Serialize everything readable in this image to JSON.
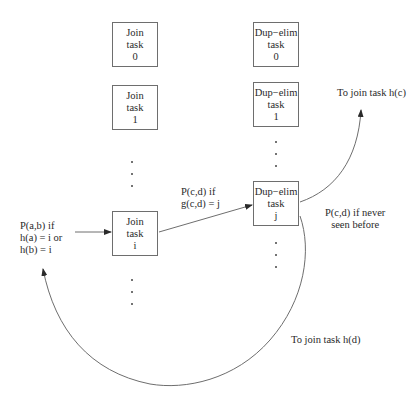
{
  "diagram": {
    "type": "dataflow",
    "join_column": {
      "tasks": [
        {
          "line1": "Join",
          "line2": "task",
          "line3": "0"
        },
        {
          "line1": "Join",
          "line2": "task",
          "line3": "1"
        },
        {
          "line1": "Join",
          "line2": "task",
          "line3": "i"
        }
      ]
    },
    "dupelim_column": {
      "tasks": [
        {
          "line1": "Dup−elim",
          "line2": "task",
          "line3": "0"
        },
        {
          "line1": "Dup−elim",
          "line2": "task",
          "line3": "1"
        },
        {
          "line1": "Dup−elim",
          "line2": "task",
          "line3": "j"
        }
      ]
    },
    "labels": {
      "input": {
        "line1": "P(a,b) if",
        "line2": "h(a) = i or",
        "line3": "h(b) = i"
      },
      "join_to_dup": {
        "line1": "P(c,d) if",
        "line2": "g(c,d) = j"
      },
      "never_seen": {
        "line1": "P(c,d) if never",
        "line2": "seen before"
      },
      "to_hc": "To join task h(c)",
      "to_hd": "To join task h(d)"
    },
    "ellipsis_glyph": "·",
    "colors": {
      "stroke": "#6e6e6e",
      "text": "#2a2a2a",
      "background": "#ffffff"
    }
  }
}
